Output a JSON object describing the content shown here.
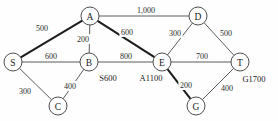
{
  "diagram": {
    "type": "weighted-graph",
    "title": "",
    "nodes": [
      {
        "id": "S",
        "label": "S",
        "x": 13,
        "y": 62,
        "r": 9
      },
      {
        "id": "A",
        "label": "A",
        "x": 90,
        "y": 16,
        "r": 9
      },
      {
        "id": "B",
        "label": "B",
        "x": 89,
        "y": 62,
        "r": 9
      },
      {
        "id": "C",
        "label": "C",
        "x": 58,
        "y": 106,
        "r": 9
      },
      {
        "id": "D",
        "label": "D",
        "x": 198,
        "y": 16,
        "r": 9
      },
      {
        "id": "E",
        "label": "E",
        "x": 162,
        "y": 62,
        "r": 9
      },
      {
        "id": "G",
        "label": "G",
        "x": 196,
        "y": 106,
        "r": 9
      },
      {
        "id": "T",
        "label": "T",
        "x": 240,
        "y": 62,
        "r": 9
      }
    ],
    "edges": [
      {
        "from": "S",
        "to": "A",
        "weight": "500",
        "wx": 42,
        "wy": 28,
        "bold": true
      },
      {
        "from": "S",
        "to": "B",
        "weight": "600",
        "wx": 51,
        "wy": 56,
        "bold": false
      },
      {
        "from": "S",
        "to": "C",
        "weight": "300",
        "wx": 25,
        "wy": 91,
        "bold": false
      },
      {
        "from": "B",
        "to": "C",
        "weight": "400",
        "wx": 70,
        "wy": 86,
        "bold": false
      },
      {
        "from": "A",
        "to": "B",
        "weight": "200",
        "wx": 83,
        "wy": 39,
        "bold": false
      },
      {
        "from": "A",
        "to": "D",
        "weight": "1,000",
        "wx": 146,
        "wy": 10,
        "bold": false
      },
      {
        "from": "A",
        "to": "E",
        "weight": "600",
        "wx": 127,
        "wy": 32,
        "bold": true
      },
      {
        "from": "B",
        "to": "E",
        "weight": "800",
        "wx": 126,
        "wy": 56,
        "bold": false
      },
      {
        "from": "D",
        "to": "E",
        "weight": "300",
        "wx": 175,
        "wy": 33,
        "bold": false
      },
      {
        "from": "D",
        "to": "T",
        "weight": "500",
        "wx": 226,
        "wy": 33,
        "bold": false
      },
      {
        "from": "E",
        "to": "T",
        "weight": "700",
        "wx": 202,
        "wy": 56,
        "bold": false
      },
      {
        "from": "E",
        "to": "G",
        "weight": "200",
        "wx": 186,
        "wy": 85,
        "bold": true
      },
      {
        "from": "G",
        "to": "T",
        "weight": "400",
        "wx": 227,
        "wy": 88,
        "bold": false
      }
    ],
    "annotations": [
      {
        "id": "b-annotation",
        "text": "S600",
        "x": 108,
        "y": 78
      },
      {
        "id": "e-annotation",
        "text": "A1100",
        "x": 151,
        "y": 78
      },
      {
        "id": "t-annotation",
        "text": "G1700",
        "x": 254,
        "y": 79
      }
    ]
  }
}
